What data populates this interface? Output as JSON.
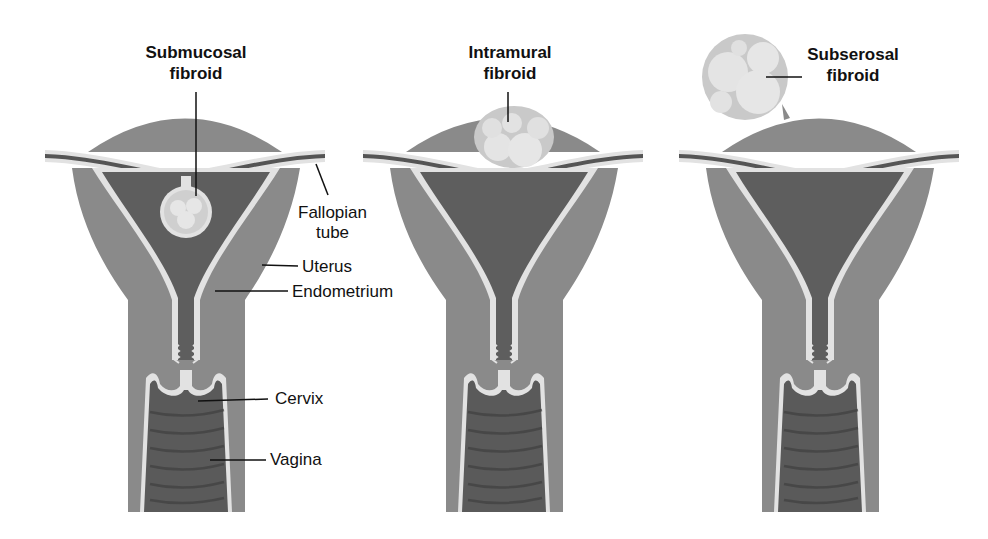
{
  "figure": {
    "colors": {
      "muscle": "#8a8a8a",
      "cavity": "#5e5e5e",
      "lining": "#e2e2e2",
      "fibroid": "#d8d8d8",
      "text": "#111111"
    },
    "panels": [
      {
        "id": "submucosal",
        "title_line1": "Submucosal",
        "title_line2": "fibroid"
      },
      {
        "id": "intramural",
        "title_line1": "Intramural",
        "title_line2": "fibroid"
      },
      {
        "id": "subserosal",
        "title_line1": "Subserosal",
        "title_line2": "fibroid"
      }
    ],
    "anatomy_labels": {
      "fallopian_line1": "Fallopian",
      "fallopian_line2": "tube",
      "uterus": "Uterus",
      "endometrium": "Endometrium",
      "cervix": "Cervix",
      "vagina": "Vagina"
    }
  }
}
